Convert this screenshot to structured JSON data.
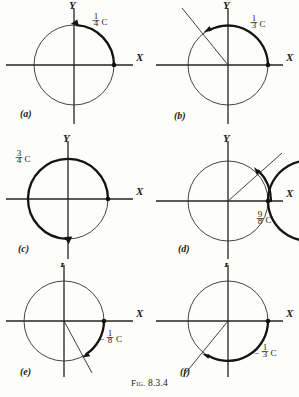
{
  "figure": {
    "caption_prefix": "Fig.",
    "caption_number": "8.3.4",
    "caption_full": "Fig. 8.3.4"
  },
  "axes": {
    "x_label": "X",
    "y_label": "Y"
  },
  "panels": [
    {
      "tag": "(a)",
      "amount_sign": "",
      "amount_numerator": "1",
      "amount_denominator": "4",
      "amount_unit": "C",
      "amount_text": "1/4 C",
      "direction": "counterclockwise",
      "start_angle_deg": 0,
      "end_angle_deg": 90,
      "sweep_turns": 0.25,
      "has_terminal_ray": false,
      "arc_layers": 1,
      "label_x": 96,
      "label_y": 22
    },
    {
      "tag": "(b)",
      "amount_sign": "",
      "amount_numerator": "1",
      "amount_denominator": "3",
      "amount_unit": "C",
      "amount_text": "1/3 C",
      "direction": "counterclockwise",
      "start_angle_deg": 0,
      "end_angle_deg": 120,
      "sweep_turns": 0.3333,
      "has_terminal_ray": true,
      "arc_layers": 1,
      "label_x": 100,
      "label_y": 24
    },
    {
      "tag": "(c)",
      "amount_sign": "",
      "amount_numerator": "3",
      "amount_denominator": "4",
      "amount_unit": "C",
      "amount_text": "3/4 C",
      "direction": "counterclockwise",
      "start_angle_deg": 0,
      "end_angle_deg": 270,
      "sweep_turns": 0.75,
      "has_terminal_ray": false,
      "arc_layers": 1,
      "label_x": 16,
      "label_y": 28
    },
    {
      "tag": "(d)",
      "amount_sign": "",
      "amount_numerator": "9",
      "amount_denominator": "8",
      "amount_unit": "C",
      "amount_text": "9/8 C",
      "direction": "counterclockwise",
      "start_angle_deg": 0,
      "end_angle_deg": 45,
      "sweep_turns": 1.125,
      "has_terminal_ray": true,
      "arc_layers": 2,
      "label_x": 108,
      "label_y": 90
    },
    {
      "tag": "(e)",
      "amount_sign": "−",
      "amount_numerator": "1",
      "amount_denominator": "8",
      "amount_unit": "C",
      "amount_text": "−1/8 C",
      "direction": "clockwise",
      "start_angle_deg": 0,
      "end_angle_deg": -45,
      "sweep_turns": -0.125,
      "has_terminal_ray": true,
      "arc_layers": 1,
      "label_x": 100,
      "label_y": 76
    },
    {
      "tag": "(f)",
      "amount_sign": "−",
      "amount_numerator": "1",
      "amount_denominator": "3",
      "amount_unit": "C",
      "amount_text": "−1/3 C",
      "direction": "clockwise",
      "start_angle_deg": 0,
      "end_angle_deg": -120,
      "sweep_turns": -0.3333,
      "has_terminal_ray": true,
      "arc_layers": 1,
      "label_x": 106,
      "label_y": 90
    }
  ]
}
